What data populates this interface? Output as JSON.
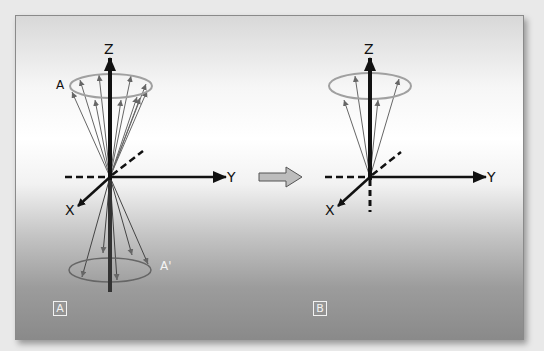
{
  "figure": {
    "panels": [
      {
        "id": "A",
        "label": "A",
        "axes": {
          "z": "Z",
          "y": "Y",
          "x": "X"
        },
        "upper_cone_label": "A",
        "lower_cone_label": "A'"
      },
      {
        "id": "B",
        "label": "B",
        "axes": {
          "z": "Z",
          "y": "Y",
          "x": "X"
        }
      }
    ],
    "transition_arrow": "right-arrow-icon",
    "colors": {
      "axis": "#111111",
      "vector": "#555555",
      "ring": "#9a9a9a",
      "arrow_fill": "#bdbdbd",
      "panel_label": "#f2f2f2"
    }
  }
}
